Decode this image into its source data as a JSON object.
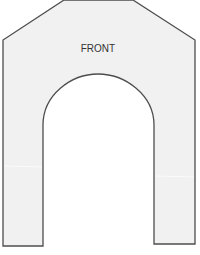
{
  "diagram": {
    "label": "FRONT",
    "colors": {
      "fill": "#f1f1f1",
      "stroke": "#4d4d4d",
      "text": "#333333",
      "background": "#ffffff"
    }
  }
}
